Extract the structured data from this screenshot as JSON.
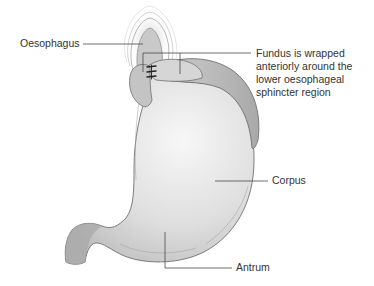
{
  "figure": {
    "colors": {
      "stomach_fill": "#dcdcdc",
      "stomach_highlight": "#f4f4f4",
      "fundus_wrap_fill": "#b9b9b9",
      "outline": "#6e6e6e",
      "leader_line": "#4a4a4a",
      "sutures": "#222222",
      "text": "#333333"
    },
    "labels": {
      "oesophagus": "Oesophagus",
      "fundus": "Fundus is wrapped anteriorly around the lower oesophageal sphincter region",
      "corpus": "Corpus",
      "antrum": "Antrum"
    }
  }
}
